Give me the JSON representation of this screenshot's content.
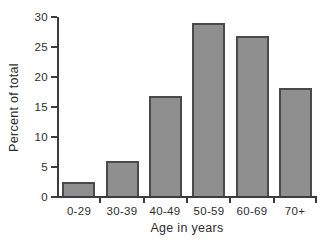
{
  "chart_data": {
    "type": "bar",
    "title": "",
    "categories": [
      "0-29",
      "30-39",
      "40-49",
      "50-59",
      "60-69",
      "70+"
    ],
    "values": [
      2.3,
      5.8,
      16.7,
      28.8,
      26.6,
      18.0
    ],
    "xlabel": "Age in years",
    "ylabel": "Percent of total",
    "ylim": [
      0,
      30
    ],
    "yticks": [
      0,
      5,
      10,
      15,
      20,
      25,
      30
    ],
    "grid": false,
    "legend": false,
    "colors": {
      "bar_fill": "#8f8f8f",
      "bar_border": "#4a4a4a",
      "axis": "#3c3c3c",
      "text": "#2e2e2e",
      "background": "#ffffff"
    }
  }
}
